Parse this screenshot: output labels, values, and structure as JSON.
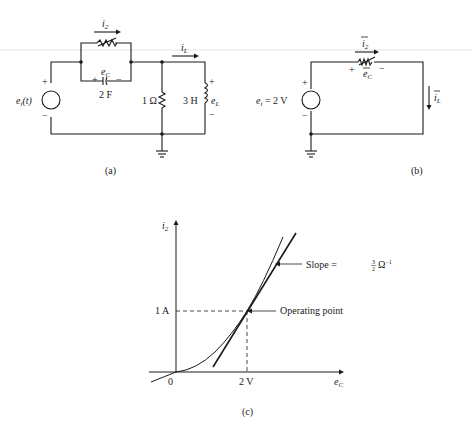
{
  "figure_a": {
    "caption": "(a)",
    "source_label": "e",
    "source_sub": "i",
    "source_arg": "(t)",
    "i2_label": "i",
    "i2_sub": "2",
    "iL_label": "i",
    "iL_sub": "L",
    "ec_label": "e",
    "ec_sub": "C",
    "capacitor_value": "2 F",
    "resistor_value": "1 Ω",
    "inductor_value": "3 H",
    "eL_label": "e",
    "eL_sub": "L",
    "plus": "+",
    "minus": "−"
  },
  "figure_b": {
    "caption": "(b)",
    "source_label": "e",
    "source_sub": "i",
    "source_value": " = 2 V",
    "i2_label": "i",
    "i2_sub": "2",
    "iL_label": "i",
    "iL_sub": "L",
    "ec_label": "e",
    "ec_sub": "C",
    "plus": "+",
    "minus": "−"
  },
  "figure_c": {
    "caption": "(c)",
    "y_axis_label": "i",
    "y_axis_sub": "2",
    "x_axis_label": "e",
    "x_axis_sub": "C",
    "origin_label": "0",
    "x_tick": "2 V",
    "y_tick": "1 A",
    "slope_label": "Slope = ",
    "slope_num": "3",
    "slope_den": "2",
    "slope_unit": "Ω",
    "slope_exp": "−1",
    "operating_point_label": "Operating point"
  }
}
